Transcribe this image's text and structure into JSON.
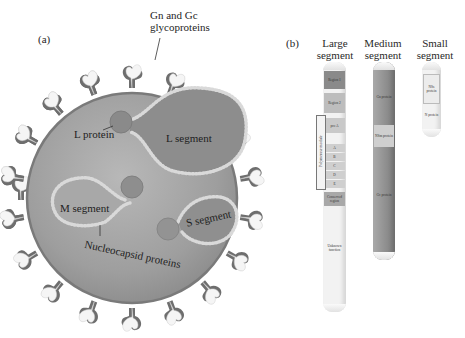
{
  "panel_a": {
    "label": "(a)",
    "glycoprotein_label_line1": "Gn and Gc",
    "glycoprotein_label_line2": "glycoproteins",
    "l_protein": "L protein",
    "l_segment": "L segment",
    "m_segment": "M segment",
    "s_segment": "S segment",
    "nucleocapsid": "Nucleocapsid proteins"
  },
  "panel_b": {
    "label": "(b)",
    "large": {
      "title_line1": "Large",
      "title_line2": "segment",
      "regions": {
        "region1": "Region 1",
        "region2": "Region 2",
        "pro_a": "pro A",
        "a": "A",
        "b": "B",
        "c": "C",
        "d": "D",
        "e": "E",
        "polymerase_module": "Polymerase module",
        "conserved_region": "Conserved region",
        "unknown_function": "Unknown function"
      }
    },
    "medium": {
      "title_line1": "Medium",
      "title_line2": "segment",
      "regions": {
        "gn": "Gn protein",
        "nsm": "NSm protein",
        "gc": "Gc protein"
      }
    },
    "small": {
      "title_line1": "Small",
      "title_line2": "segment",
      "regions": {
        "nss": "NSs protein",
        "n": "N protein"
      }
    }
  }
}
